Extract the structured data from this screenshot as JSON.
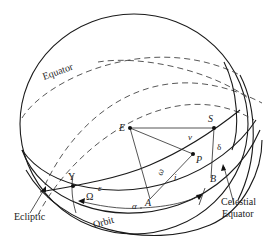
{
  "diagram": {
    "curve_labels": {
      "equator_top": "Equator",
      "ecliptic": "Ecliptic",
      "orbit": "Orbit",
      "celestial_equator_line1": "Celestial",
      "celestial_equator_line2": "Equator"
    },
    "points": {
      "earth": "E",
      "sun": "S",
      "planet": "P",
      "ascending_node": "A",
      "b_point": "B",
      "vernal_equinox": "Υ"
    },
    "angles": {
      "obliquity": "ε",
      "longitude_node": "Ω",
      "argument_perihelion": "ω",
      "inclination": "i",
      "true_anomaly": "ν",
      "declination": "δ",
      "right_ascension": "α"
    }
  }
}
